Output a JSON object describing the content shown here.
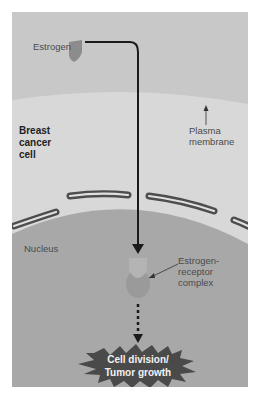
{
  "diagram": {
    "labels": {
      "estrogen": "Estrogen",
      "cell_line1": "Breast",
      "cell_line2": "cancer",
      "cell_line3": "cell",
      "plasma_line1": "Plasma",
      "plasma_line2": "membrane",
      "nucleus": "Nucleus",
      "complex_line1": "Estrogen-",
      "complex_line2": "receptor",
      "complex_line3": "complex",
      "outcome_line1": "Cell division/",
      "outcome_line2": "Tumor growth"
    },
    "colors": {
      "extracellular": "#c9c9c9",
      "cytoplasm": "#d6d6d6",
      "nucleus": "#a6a6a6",
      "envelope": "#4d4d4d",
      "arrow": "#1a1a1a",
      "starburst": "#4a4a4a"
    }
  }
}
